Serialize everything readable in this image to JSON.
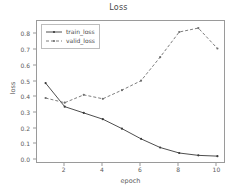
{
  "chart_data": {
    "type": "line",
    "title": "Loss",
    "xlabel": "epoch",
    "ylabel": "loss",
    "x": [
      1,
      2,
      3,
      4,
      5,
      6,
      7,
      8,
      9,
      10
    ],
    "xlim": [
      0.55,
      10.45
    ],
    "ylim": [
      -0.025,
      0.885
    ],
    "xticks": [
      2,
      4,
      6,
      8,
      10
    ],
    "xticklabels": [
      "2",
      "4",
      "6",
      "8",
      "10"
    ],
    "yticks": [
      0.0,
      0.1,
      0.2,
      0.3,
      0.4,
      0.5,
      0.6,
      0.7,
      0.8
    ],
    "yticklabels": [
      "0.0",
      "0.1",
      "0.2",
      "0.3",
      "0.4",
      "0.5",
      "0.6",
      "0.7",
      "0.8"
    ],
    "grid": false,
    "legend_position": "upper left",
    "series": [
      {
        "name": "train_loss",
        "values": [
          0.49,
          0.34,
          0.3,
          0.26,
          0.2,
          0.135,
          0.08,
          0.045,
          0.03,
          0.025
        ],
        "color": "#3a3a3a",
        "linestyle": "solid",
        "marker": "dot"
      },
      {
        "name": "valid_loss",
        "values": [
          0.395,
          0.365,
          0.415,
          0.39,
          0.445,
          0.505,
          0.655,
          0.815,
          0.84,
          0.71
        ],
        "color": "#6e6e6e",
        "linestyle": "dashed",
        "marker": "dot"
      }
    ]
  },
  "legend": {
    "items": [
      {
        "label": "train_loss"
      },
      {
        "label": "valid_loss"
      }
    ]
  }
}
